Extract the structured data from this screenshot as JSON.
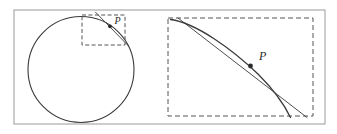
{
  "figure": {
    "background_color": "#ffffff",
    "frame": {
      "name": "outer-frame",
      "x": 14,
      "y": 10,
      "width": 311,
      "height": 114,
      "stroke": "#9a9a9a",
      "stroke_width": 1
    },
    "curve_color": "#3a3a3a",
    "dash_color": "#555555",
    "point_color": "#2b2b2b"
  },
  "left_panel": {
    "name": "overview-panel",
    "circle": {
      "name": "circle",
      "cx": 81,
      "cy": 69.5,
      "r": 53,
      "stroke": "#3a3a3a",
      "stroke_width": 1.1
    },
    "detail_box": {
      "name": "zoom-region-box",
      "x": 82,
      "y": 15,
      "width": 43,
      "height": 30,
      "stroke": "#555555",
      "dash_pattern": "4,2.4"
    },
    "tangent": {
      "name": "tangent-line",
      "x1": 95.5,
      "y1": 12.2,
      "x2": 128.5,
      "y2": 46.0,
      "stroke": "#3a3a3a",
      "stroke_width": 0.9
    },
    "point": {
      "name": "point-p",
      "cx": 110.0,
      "cy": 26.3,
      "r": 1.9,
      "label": "P",
      "label_x": 114.5,
      "label_y": 24.0,
      "label_size": 10
    }
  },
  "right_panel": {
    "name": "magnified-panel",
    "detail_box": {
      "name": "magnified-region-box",
      "x": 168,
      "y": 18,
      "width": 145,
      "height": 98,
      "stroke": "#555555",
      "dash_pattern": "5,3"
    },
    "arc": {
      "name": "magnified-arc",
      "path": "M 170.5 19.5 C 196 23 232 49 258 74 C 274 90 285 106 290.5 117.5",
      "stroke": "#3a3a3a",
      "stroke_width": 1.3
    },
    "tangent": {
      "name": "magnified-tangent-line",
      "x1": 178.0,
      "y1": 18.0,
      "x2": 307.0,
      "y2": 117.5,
      "stroke": "#3a3a3a",
      "stroke_width": 0.9
    },
    "point": {
      "name": "point-p",
      "cx": 250.5,
      "cy": 66.0,
      "r": 2.4,
      "label": "P",
      "label_x": 259,
      "label_y": 60,
      "label_size": 12
    }
  }
}
